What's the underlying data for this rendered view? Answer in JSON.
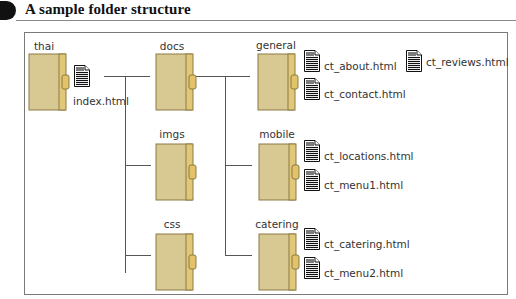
{
  "header": {
    "title": "A sample folder structure"
  },
  "colors": {
    "folder_fill": "#d8c992",
    "folder_edge": "#8b7a45",
    "folder_tab": "#e2c36a",
    "connector": "#555555",
    "frame": "#7a7a7a"
  },
  "folders": {
    "thai": {
      "label": "thai",
      "icon": "folder-icon"
    },
    "docs": {
      "label": "docs",
      "icon": "folder-icon"
    },
    "imgs": {
      "label": "imgs",
      "icon": "folder-icon"
    },
    "css": {
      "label": "css",
      "icon": "folder-icon"
    },
    "general": {
      "label": "general",
      "icon": "folder-icon"
    },
    "mobile": {
      "label": "mobile",
      "icon": "folder-icon"
    },
    "catering": {
      "label": "catering",
      "icon": "folder-icon"
    }
  },
  "files": {
    "index": {
      "label": "index.html",
      "icon": "document-icon",
      "parent": "thai"
    },
    "ct_about": {
      "label": "ct_about.html",
      "icon": "document-icon",
      "parent": "general"
    },
    "ct_contact": {
      "label": "ct_contact.html",
      "icon": "document-icon",
      "parent": "general"
    },
    "ct_reviews": {
      "label": "ct_reviews.html",
      "icon": "document-icon",
      "parent": "general"
    },
    "ct_locations": {
      "label": "ct_locations.html",
      "icon": "document-icon",
      "parent": "mobile"
    },
    "ct_menu1": {
      "label": "ct_menu1.html",
      "icon": "document-icon",
      "parent": "mobile"
    },
    "ct_catering": {
      "label": "ct_catering.html",
      "icon": "document-icon",
      "parent": "catering"
    },
    "ct_menu2": {
      "label": "ct_menu2.html",
      "icon": "document-icon",
      "parent": "catering"
    }
  }
}
